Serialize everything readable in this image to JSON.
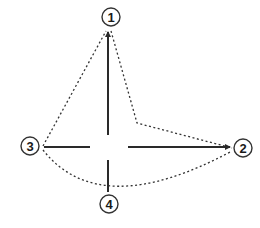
{
  "diagram": {
    "type": "step-sequence",
    "colors": {
      "stroke": "#2a2a2a",
      "dotted": "#333333",
      "background": "#ffffff"
    },
    "nodes": [
      {
        "id": "1",
        "label": "1",
        "cx": 111,
        "cy": 17
      },
      {
        "id": "2",
        "label": "2",
        "cx": 243,
        "cy": 148
      },
      {
        "id": "3",
        "label": "3",
        "cx": 30,
        "cy": 146
      },
      {
        "id": "4",
        "label": "4",
        "cx": 109,
        "cy": 204
      }
    ],
    "solid_strokes": [
      {
        "name": "vertical-upper",
        "from": [
          108,
          135
        ],
        "to": [
          108,
          30
        ],
        "arrow": "end"
      },
      {
        "name": "vertical-lower",
        "from": [
          108,
          160
        ],
        "to": [
          108,
          192
        ],
        "arrow": "none"
      },
      {
        "name": "horizontal-left",
        "from": [
          44,
          147
        ],
        "to": [
          90,
          147
        ],
        "arrow": "none"
      },
      {
        "name": "horizontal-right",
        "from": [
          128,
          147
        ],
        "to": [
          232,
          147
        ],
        "arrow": "end"
      }
    ],
    "dotted_paths": [
      {
        "name": "path-1-to-2",
        "from": "1",
        "to": "2",
        "via": [
          137,
          123
        ]
      },
      {
        "name": "path-3-to-1",
        "from": "3",
        "to": "1"
      },
      {
        "name": "path-3-to-2-curve",
        "from": "3",
        "to": "2",
        "curve_through": [
          113,
          192
        ]
      }
    ]
  }
}
